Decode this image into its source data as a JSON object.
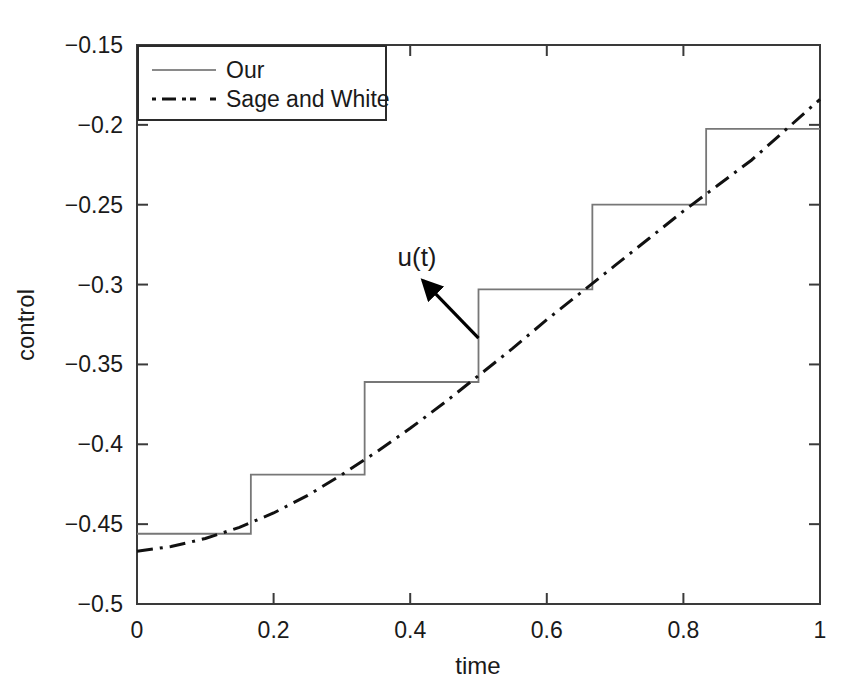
{
  "chart_data": {
    "type": "line",
    "title": "",
    "xlabel": "time",
    "ylabel": "control",
    "xlim": [
      0,
      1
    ],
    "ylim": [
      -0.5,
      -0.15
    ],
    "grid": false,
    "legend_position": "top-left",
    "xticks": [
      0,
      0.2,
      0.4,
      0.6,
      0.8,
      1
    ],
    "xtick_labels": [
      "0",
      "0.2",
      "0.4",
      "0.6",
      "0.8",
      "1"
    ],
    "yticks": [
      -0.5,
      -0.45,
      -0.4,
      -0.35,
      -0.3,
      -0.25,
      -0.2,
      -0.15
    ],
    "ytick_labels": [
      "-0.5",
      "-0.45",
      "-0.4",
      "-0.35",
      "-0.3",
      "-0.25",
      "-0.2",
      "-0.15"
    ],
    "series": [
      {
        "name": "Our",
        "style": "solid-step",
        "color": "#6b6b6b",
        "step_edges": [
          0,
          0.1667,
          0.3333,
          0.5,
          0.6667,
          0.8333,
          1
        ],
        "values": [
          -0.456,
          -0.419,
          -0.361,
          -0.303,
          -0.25,
          -0.2025
        ]
      },
      {
        "name": "Sage and White",
        "style": "dash-dot",
        "color": "#111111",
        "x": [
          0,
          0.05,
          0.1,
          0.15,
          0.2,
          0.25,
          0.3,
          0.35,
          0.4,
          0.45,
          0.5,
          0.55,
          0.6,
          0.65,
          0.7,
          0.75,
          0.8,
          0.85,
          0.9,
          0.95,
          1
        ],
        "y": [
          -0.467,
          -0.464,
          -0.459,
          -0.452,
          -0.443,
          -0.432,
          -0.419,
          -0.405,
          -0.39,
          -0.374,
          -0.357,
          -0.34,
          -0.322,
          -0.305,
          -0.288,
          -0.271,
          -0.254,
          -0.238,
          -0.222,
          -0.203,
          -0.184
        ]
      }
    ],
    "annotations": [
      {
        "text": "u(t)",
        "label_x": 0.41,
        "label_y": -0.2885,
        "arrow_from_x": 0.5,
        "arrow_from_y": -0.3335,
        "arrow_to_x": 0.4185,
        "arrow_to_y": -0.2975
      }
    ]
  },
  "legend": {
    "entries": [
      {
        "label": "Our",
        "style": "solid"
      },
      {
        "label": "Sage and White",
        "style": "dash-dot"
      }
    ]
  },
  "axis": {
    "x_title": "time",
    "y_title": "control"
  }
}
